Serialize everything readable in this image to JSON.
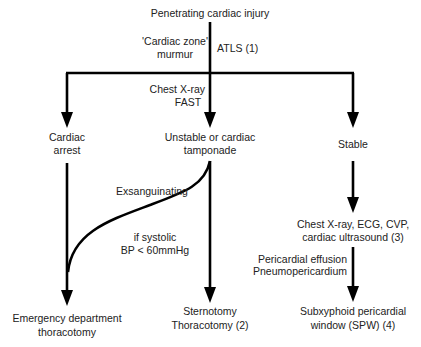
{
  "title": "Penetrating cardiac injury",
  "top_labels": {
    "left_line1": "'Cardiac zone'",
    "left_line2": "murmur",
    "right": "ATLS (1)"
  },
  "branch_labels": {
    "line1": "Chest X-ray",
    "line2": "FAST"
  },
  "nodes": {
    "cardiac_arrest": {
      "line1": "Cardiac",
      "line2": "arrest"
    },
    "unstable": {
      "line1": "Unstable or cardiac",
      "line2": "tamponade"
    },
    "stable": {
      "line1": "Stable"
    },
    "investigations": {
      "line1": "Chest X-ray, ECG, CVP,",
      "line2": "cardiac ultrasound (3)"
    },
    "edt": {
      "line1": "Emergency department",
      "line2": "thoracotomy"
    },
    "sternotomy": {
      "line1": "Sternotomy",
      "line2": "Thoracotomy (2)"
    },
    "spw": {
      "line1": "Subxyphoid pericardial",
      "line2": "window (SPW) (4)"
    }
  },
  "edge_labels": {
    "exsanguinating": "Exsanguinating",
    "systolic_line1": "if systolic",
    "systolic_line2": "BP < 60mmHg",
    "effusion_line1": "Pericardial effusion",
    "effusion_line2": "Pneumopericardium"
  },
  "colors": {
    "line": "#000000",
    "text": "#222222",
    "background": "#ffffff"
  }
}
